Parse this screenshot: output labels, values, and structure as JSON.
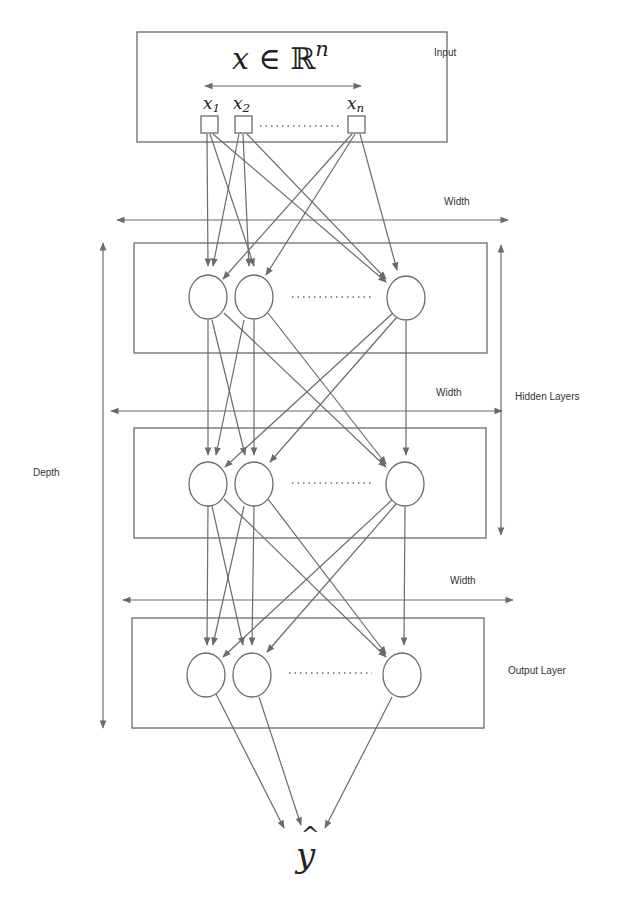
{
  "diagram": {
    "title_math": {
      "x": "x",
      "in": "∈",
      "R": "ℝ",
      "sup": "n"
    },
    "labels": {
      "input": "Input",
      "width_1": "Width",
      "width_2": "Width",
      "width_3": "Width",
      "hidden_layers": "Hidden Layers",
      "depth": "Depth",
      "output_layer": "Output Layer"
    },
    "input_nodes": [
      {
        "base": "x",
        "sub": "1"
      },
      {
        "base": "x",
        "sub": "2"
      },
      {
        "base": "x",
        "sub": "n"
      }
    ],
    "output_symbol": {
      "base": "y",
      "hat": "^"
    },
    "layers": [
      {
        "name": "input",
        "box": [
          137,
          30,
          310,
          112
        ]
      },
      {
        "name": "hidden-1",
        "box": [
          134,
          243,
          353,
          110
        ]
      },
      {
        "name": "hidden-2",
        "box": [
          134,
          428,
          352,
          110
        ]
      },
      {
        "name": "output",
        "box": [
          132,
          618,
          352,
          110
        ]
      }
    ],
    "colors": {
      "stroke": "#6b6b6b",
      "text": "#333333",
      "background": "#ffffff"
    }
  }
}
